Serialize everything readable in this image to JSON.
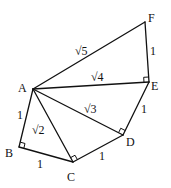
{
  "diagram": {
    "type": "geometry",
    "stroke_color": "#111111",
    "background": "#ffffff",
    "points": {
      "A": {
        "label": "A",
        "x": 33,
        "y": 89
      },
      "B": {
        "label": "B",
        "x": 19,
        "y": 147
      },
      "C": {
        "label": "C",
        "x": 73,
        "y": 162
      },
      "D": {
        "label": "D",
        "x": 123,
        "y": 135
      },
      "E": {
        "label": "E",
        "x": 149,
        "y": 82
      },
      "F": {
        "label": "F",
        "x": 145,
        "y": 22
      }
    },
    "point_labels": [
      {
        "id": "A",
        "text": "A",
        "x": 18,
        "y": 92
      },
      {
        "id": "B",
        "text": "B",
        "x": 5,
        "y": 157
      },
      {
        "id": "C",
        "text": "C",
        "x": 67,
        "y": 181
      },
      {
        "id": "D",
        "text": "D",
        "x": 126,
        "y": 146
      },
      {
        "id": "E",
        "text": "E",
        "x": 151,
        "y": 90
      },
      {
        "id": "F",
        "text": "F",
        "x": 148,
        "y": 22
      }
    ],
    "edges": [
      {
        "from": "A",
        "to": "B",
        "label": "1",
        "lx": 17,
        "ly": 119
      },
      {
        "from": "B",
        "to": "C",
        "label": "1",
        "lx": 37,
        "ly": 168
      },
      {
        "from": "A",
        "to": "C",
        "label": "√2",
        "lx": 32,
        "ly": 134
      },
      {
        "from": "C",
        "to": "D",
        "label": "1",
        "lx": 99,
        "ly": 160
      },
      {
        "from": "A",
        "to": "D",
        "label": "√3",
        "lx": 84,
        "ly": 113
      },
      {
        "from": "D",
        "to": "E",
        "label": "1",
        "lx": 141,
        "ly": 113
      },
      {
        "from": "A",
        "to": "E",
        "label": "√4",
        "lx": 91,
        "ly": 81
      },
      {
        "from": "E",
        "to": "F",
        "label": "1",
        "lx": 150,
        "ly": 55
      },
      {
        "from": "A",
        "to": "F",
        "label": "√5",
        "lx": 75,
        "ly": 55
      }
    ],
    "right_angles": [
      {
        "at": "B",
        "label": "right-angle-B"
      },
      {
        "at": "C",
        "label": "right-angle-C"
      },
      {
        "at": "D",
        "label": "right-angle-D"
      },
      {
        "at": "E",
        "label": "right-angle-E"
      }
    ]
  }
}
